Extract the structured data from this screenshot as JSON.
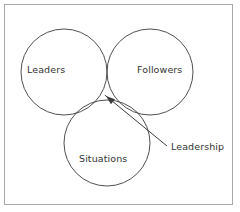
{
  "diagram": {
    "type": "venn",
    "title": "",
    "frame": {
      "visible": true,
      "border_color": "#a8a8a8"
    },
    "stroke_color": "#3c3c3c",
    "text_color": "#333333",
    "circles": [
      {
        "id": "leaders",
        "label": "Leaders",
        "cx": 64,
        "cy": 72,
        "r": 43
      },
      {
        "id": "followers",
        "label": "Followers",
        "cx": 150,
        "cy": 72,
        "r": 43
      },
      {
        "id": "situations",
        "label": "Situations",
        "cx": 107,
        "cy": 143,
        "r": 43
      }
    ],
    "annotation": {
      "label": "Leadership",
      "pointer_from_x": 167,
      "pointer_from_y": 146,
      "pointer_to_x": 106,
      "pointer_to_y": 96
    }
  }
}
